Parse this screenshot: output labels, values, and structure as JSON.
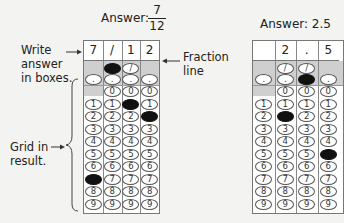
{
  "left_example": {
    "answer_label": "Answer:",
    "fraction_numerator": "7",
    "fraction_denominator": "12",
    "boxes": [
      "7",
      "/",
      "1",
      "2"
    ],
    "filled": {
      "slash": [
        1
      ],
      "dot": [],
      "digits": [
        7,
        null,
        1,
        2
      ]
    }
  },
  "right_example": {
    "answer_label": "Answer: 2.5",
    "boxes": [
      "",
      "2",
      ".",
      "5"
    ],
    "filled": {
      "slash": [],
      "dot": [
        2
      ],
      "digits": [
        null,
        2,
        null,
        5
      ]
    }
  },
  "annotations": {
    "write_answer": "Write\nanswer\nin boxes.",
    "write_answer_lines": [
      "Write",
      "answer",
      "in boxes."
    ],
    "fraction_line_lines": [
      "Fraction",
      "line"
    ],
    "grid_result_lines": [
      "Grid in",
      "result."
    ]
  },
  "bubble_symbols": {
    "slash": "/",
    "dot": ".",
    "digits": [
      "0",
      "1",
      "2",
      "3",
      "4",
      "5",
      "6",
      "7",
      "8",
      "9"
    ]
  },
  "colors": {
    "background": "#f3f3f1",
    "shade": "#cfcfcf",
    "filled": "#111111",
    "border": "#777777"
  }
}
